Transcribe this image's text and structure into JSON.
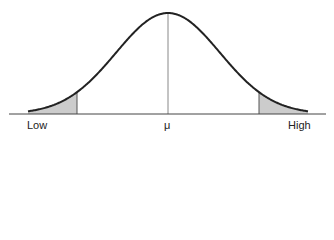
{
  "diagram": {
    "type": "normal-distribution-curve",
    "labels": {
      "low": "Low",
      "mean": "μ",
      "high": "High"
    },
    "shaded_tails": [
      "left",
      "right"
    ],
    "colors": {
      "curve": "#222222",
      "shade": "#cccccc",
      "axis": "#444444",
      "mean_line": "#777777"
    }
  },
  "chart_data": {
    "type": "area",
    "title": "",
    "xlabel": "",
    "ylabel": "",
    "tick_labels": [
      "Low",
      "μ",
      "High"
    ],
    "grid": false
  }
}
